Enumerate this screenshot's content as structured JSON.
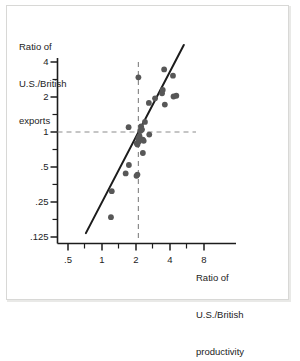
{
  "figure": {
    "background_color": "#ffffff",
    "frame_color": "#d8d8d6",
    "ink_color": "#1c1c1c",
    "point_color": "#575757",
    "dashed_color": "#8c8c8c"
  },
  "axes": {
    "y_title_lines": [
      "Ratio of",
      "U.S./British",
      "exports"
    ],
    "x_title_lines": [
      "Ratio of",
      "U.S./British",
      "productivity"
    ]
  },
  "chart_data": {
    "type": "scatter",
    "title": "",
    "xlabel": "Ratio of U.S./British productivity",
    "ylabel": "Ratio of U.S./British exports",
    "xscale": "log",
    "yscale": "log",
    "grid": false,
    "legend": null,
    "xlim": [
      0.35,
      11.0
    ],
    "ylim": [
      0.09,
      6.2
    ],
    "xticks": [
      0.5,
      1,
      2,
      4,
      8
    ],
    "xtick_labels": [
      ".5",
      "1",
      "2",
      "4",
      "8"
    ],
    "yticks": [
      0.125,
      0.25,
      0.5,
      1,
      2,
      4
    ],
    "ytick_labels": [
      ".125",
      ".25",
      ".5",
      "1",
      "2",
      "4"
    ],
    "x_minor_ticks": [
      0.7,
      1.4,
      2.8,
      5.6
    ],
    "y_minor_ticks": [
      0.177,
      0.354,
      0.707,
      1.414,
      2.828,
      5.0
    ],
    "reference_lines": [
      {
        "orientation": "vertical",
        "value": 2.1,
        "style": "dashed"
      },
      {
        "orientation": "horizontal",
        "value": 1.0,
        "style": "dashed"
      }
    ],
    "fit_line": {
      "style": "solid",
      "x_start": 0.72,
      "y_start": 0.135,
      "x_end": 5.3,
      "y_end": 5.6
    },
    "points": [
      {
        "x": 1.2,
        "y": 0.185
      },
      {
        "x": 1.22,
        "y": 0.31
      },
      {
        "x": 1.62,
        "y": 0.44
      },
      {
        "x": 1.73,
        "y": 0.52
      },
      {
        "x": 2.02,
        "y": 0.42
      },
      {
        "x": 2.06,
        "y": 0.43
      },
      {
        "x": 2.3,
        "y": 0.66
      },
      {
        "x": 1.72,
        "y": 1.1
      },
      {
        "x": 2.03,
        "y": 0.8
      },
      {
        "x": 2.06,
        "y": 0.78
      },
      {
        "x": 2.12,
        "y": 0.83
      },
      {
        "x": 2.1,
        "y": 0.88
      },
      {
        "x": 2.15,
        "y": 0.92
      },
      {
        "x": 2.18,
        "y": 1.02
      },
      {
        "x": 2.22,
        "y": 1.12
      },
      {
        "x": 2.26,
        "y": 1.05
      },
      {
        "x": 2.3,
        "y": 0.86
      },
      {
        "x": 2.34,
        "y": 0.84
      },
      {
        "x": 2.4,
        "y": 1.22
      },
      {
        "x": 2.62,
        "y": 0.95
      },
      {
        "x": 2.1,
        "y": 2.95
      },
      {
        "x": 2.6,
        "y": 1.78
      },
      {
        "x": 2.95,
        "y": 1.95
      },
      {
        "x": 3.4,
        "y": 2.15
      },
      {
        "x": 3.45,
        "y": 2.3
      },
      {
        "x": 3.55,
        "y": 3.45
      },
      {
        "x": 3.6,
        "y": 1.72
      },
      {
        "x": 4.25,
        "y": 3.05
      },
      {
        "x": 4.3,
        "y": 2.02
      },
      {
        "x": 4.55,
        "y": 2.05
      }
    ]
  }
}
